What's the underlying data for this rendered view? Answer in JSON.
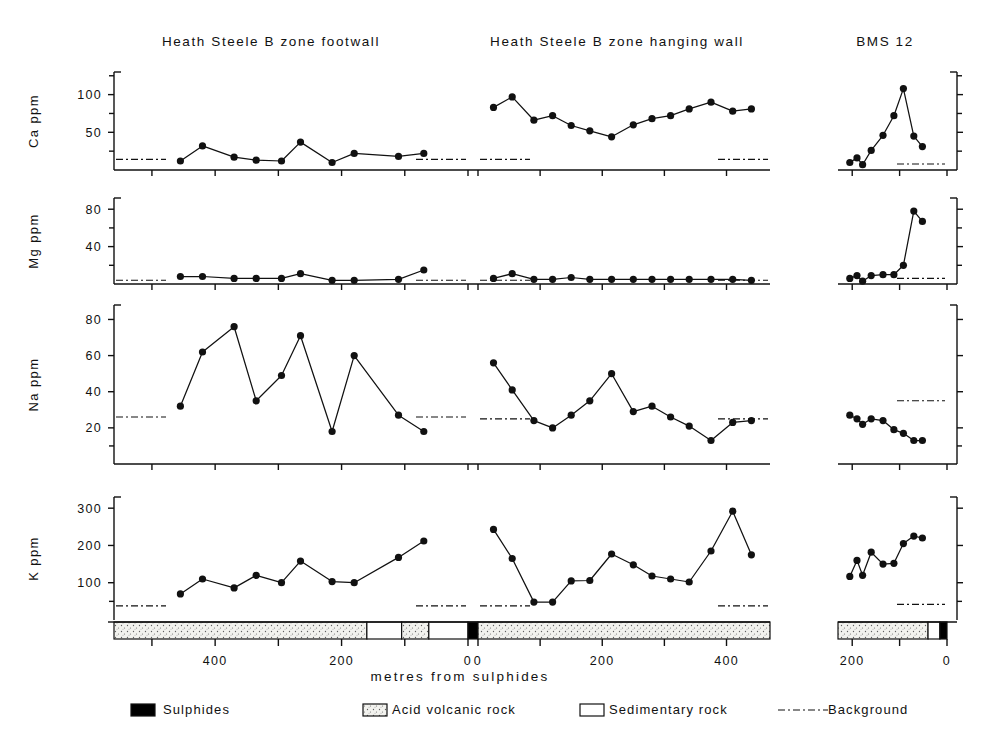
{
  "figure": {
    "xlabel": "metres from sulphides",
    "panel_titles": [
      "Heath Steele B zone footwall",
      "Heath Steele B zone hanging wall",
      "BMS 12"
    ],
    "row_labels": [
      "Ca ppm",
      "Mg ppm",
      "Na ppm",
      "K ppm"
    ]
  },
  "legend": {
    "items": [
      {
        "key": "sulphides",
        "label": "Sulphides",
        "swatch": "black-box",
        "color": "#000000"
      },
      {
        "key": "acid-volcanic",
        "label": "Acid volcanic rock",
        "swatch": "stippled-box",
        "color": "#e8e8e4"
      },
      {
        "key": "sedimentary",
        "label": "Sedimentary rock",
        "swatch": "white-box",
        "color": "#ffffff"
      },
      {
        "key": "background",
        "label": "Background",
        "swatch": "dash-dot-line",
        "color": "#111111"
      }
    ]
  },
  "axes": {
    "x_footwall": {
      "ticks": [
        500,
        400,
        300,
        200,
        100,
        0
      ],
      "labels": [
        "",
        "400",
        "",
        "200",
        "",
        "0"
      ],
      "range": [
        560,
        0
      ],
      "direction": "right-to-left"
    },
    "x_hangingwall": {
      "ticks": [
        0,
        100,
        200,
        300,
        400,
        500
      ],
      "labels": [
        "0",
        "",
        "200",
        "",
        "400",
        ""
      ],
      "range": [
        0,
        470
      ],
      "direction": "left-to-right"
    },
    "x_bms12": {
      "ticks": [
        200,
        100,
        0
      ],
      "labels": [
        "200",
        "",
        "0"
      ],
      "range": [
        230,
        0
      ],
      "direction": "right-to-left"
    },
    "y_ca": {
      "label": "Ca ppm",
      "ticks": [
        50,
        100
      ],
      "minor": [
        25,
        75,
        125
      ],
      "range": [
        0,
        130
      ]
    },
    "y_mg": {
      "label": "Mg ppm",
      "ticks": [
        40,
        80
      ],
      "minor": [
        20,
        60
      ],
      "range": [
        0,
        92
      ]
    },
    "y_na": {
      "label": "Na ppm",
      "ticks": [
        20,
        40,
        60,
        80
      ],
      "minor": [
        10
      ],
      "range": [
        0,
        88
      ]
    },
    "y_k": {
      "label": "K ppm",
      "ticks": [
        100,
        200,
        300
      ],
      "minor": [
        50
      ],
      "range": [
        0,
        330
      ]
    }
  },
  "chart_data": [
    {
      "type": "line",
      "title": "Ca ppm - Heath Steele B zone footwall",
      "panel": "footwall",
      "element": "Ca",
      "xlabel": "metres from sulphides",
      "ylabel": "Ca ppm",
      "xlim": [
        560,
        0
      ],
      "ylim": [
        0,
        130
      ],
      "grid": false,
      "background_level": 14,
      "x": [
        455,
        420,
        370,
        335,
        295,
        265,
        215,
        180,
        110,
        70
      ],
      "values": [
        12,
        32,
        17,
        13,
        12,
        37,
        10,
        22,
        18,
        22
      ]
    },
    {
      "type": "line",
      "title": "Ca ppm - Heath Steele B zone hanging wall",
      "panel": "hangingwall",
      "element": "Ca",
      "xlabel": "metres from sulphides",
      "ylabel": "Ca ppm",
      "xlim": [
        0,
        470
      ],
      "ylim": [
        0,
        130
      ],
      "grid": false,
      "background_level": 14,
      "x": [
        25,
        55,
        90,
        120,
        150,
        180,
        215,
        250,
        280,
        310,
        340,
        375,
        410,
        440
      ],
      "values": [
        83,
        97,
        66,
        72,
        59,
        52,
        44,
        60,
        68,
        72,
        81,
        90,
        78,
        81
      ]
    },
    {
      "type": "line",
      "title": "Ca ppm - BMS 12",
      "panel": "bms12",
      "element": "Ca",
      "xlabel": "metres from sulphides",
      "ylabel": "Ca ppm",
      "xlim": [
        230,
        0
      ],
      "ylim": [
        0,
        130
      ],
      "grid": false,
      "background_level": 8,
      "x": [
        205,
        190,
        178,
        160,
        135,
        112,
        92,
        70,
        52
      ],
      "values": [
        10,
        16,
        7,
        26,
        46,
        72,
        108,
        45,
        31
      ]
    },
    {
      "type": "line",
      "title": "Mg ppm - Heath Steele B zone footwall",
      "panel": "footwall",
      "element": "Mg",
      "xlabel": "metres from sulphides",
      "ylabel": "Mg ppm",
      "xlim": [
        560,
        0
      ],
      "ylim": [
        0,
        92
      ],
      "grid": false,
      "background_level": 4,
      "x": [
        455,
        420,
        370,
        335,
        295,
        265,
        215,
        180,
        110,
        70
      ],
      "values": [
        8,
        8,
        6,
        6,
        6,
        11,
        4,
        4,
        5,
        15
      ]
    },
    {
      "type": "line",
      "title": "Mg ppm - Heath Steele B zone hanging wall",
      "panel": "hangingwall",
      "element": "Mg",
      "xlabel": "metres from sulphides",
      "ylabel": "Mg ppm",
      "xlim": [
        0,
        470
      ],
      "ylim": [
        0,
        92
      ],
      "grid": false,
      "background_level": 4,
      "x": [
        25,
        55,
        90,
        120,
        150,
        180,
        215,
        250,
        280,
        310,
        340,
        375,
        410,
        440
      ],
      "values": [
        6,
        11,
        5,
        5,
        7,
        5,
        5,
        5,
        5,
        5,
        5,
        5,
        5,
        4
      ]
    },
    {
      "type": "line",
      "title": "Mg ppm - BMS 12",
      "panel": "bms12",
      "element": "Mg",
      "xlabel": "metres from sulphides",
      "ylabel": "Mg ppm",
      "xlim": [
        230,
        0
      ],
      "ylim": [
        0,
        92
      ],
      "grid": false,
      "background_level": 6,
      "x": [
        205,
        190,
        178,
        160,
        135,
        112,
        92,
        70,
        52
      ],
      "values": [
        6,
        9,
        3,
        9,
        10,
        10,
        20,
        78,
        67
      ]
    },
    {
      "type": "line",
      "title": "Na ppm - Heath Steele B zone footwall",
      "panel": "footwall",
      "element": "Na",
      "xlabel": "metres from sulphides",
      "ylabel": "Na ppm",
      "xlim": [
        560,
        0
      ],
      "ylim": [
        0,
        88
      ],
      "grid": false,
      "background_level": 26,
      "x": [
        455,
        420,
        370,
        335,
        295,
        265,
        215,
        180,
        110,
        70
      ],
      "values": [
        32,
        62,
        76,
        35,
        49,
        71,
        18,
        60,
        27,
        18
      ]
    },
    {
      "type": "line",
      "title": "Na ppm - Heath Steele B zone hanging wall",
      "panel": "hangingwall",
      "element": "Na",
      "xlabel": "metres from sulphides",
      "ylabel": "Na ppm",
      "xlim": [
        0,
        470
      ],
      "ylim": [
        0,
        88
      ],
      "grid": false,
      "background_level": 25,
      "x": [
        25,
        55,
        90,
        120,
        150,
        180,
        215,
        250,
        280,
        310,
        340,
        375,
        410,
        440
      ],
      "values": [
        56,
        41,
        24,
        20,
        27,
        35,
        50,
        29,
        32,
        26,
        21,
        13,
        23,
        24
      ]
    },
    {
      "type": "line",
      "title": "Na ppm - BMS 12",
      "panel": "bms12",
      "element": "Na",
      "xlabel": "metres from sulphides",
      "ylabel": "Na ppm",
      "xlim": [
        230,
        0
      ],
      "ylim": [
        0,
        88
      ],
      "grid": false,
      "background_level": 35,
      "x": [
        205,
        190,
        178,
        160,
        135,
        112,
        92,
        70,
        52
      ],
      "values": [
        27,
        25,
        22,
        25,
        24,
        19,
        17,
        13,
        13
      ]
    },
    {
      "type": "line",
      "title": "K ppm - Heath Steele B zone footwall",
      "panel": "footwall",
      "element": "K",
      "xlabel": "metres from sulphides",
      "ylabel": "K ppm",
      "xlim": [
        560,
        0
      ],
      "ylim": [
        0,
        330
      ],
      "grid": false,
      "background_level": 38,
      "x": [
        455,
        420,
        370,
        335,
        295,
        265,
        215,
        180,
        110,
        70
      ],
      "values": [
        70,
        110,
        86,
        120,
        100,
        158,
        103,
        100,
        168,
        212
      ]
    },
    {
      "type": "line",
      "title": "K ppm - Heath Steele B zone hanging wall",
      "panel": "hangingwall",
      "element": "K",
      "xlabel": "metres from sulphides",
      "ylabel": "K ppm",
      "xlim": [
        0,
        470
      ],
      "ylim": [
        0,
        330
      ],
      "grid": false,
      "background_level": 38,
      "x": [
        25,
        55,
        90,
        120,
        150,
        180,
        215,
        250,
        280,
        310,
        340,
        375,
        410,
        440
      ],
      "values": [
        243,
        165,
        48,
        48,
        105,
        106,
        177,
        148,
        118,
        110,
        102,
        185,
        292,
        175
      ]
    },
    {
      "type": "line",
      "title": "K ppm - BMS 12",
      "panel": "bms12",
      "element": "K",
      "xlabel": "metres from sulphides",
      "ylabel": "K ppm",
      "xlim": [
        230,
        0
      ],
      "ylim": [
        0,
        330
      ],
      "grid": false,
      "background_level": 42,
      "x": [
        205,
        190,
        178,
        160,
        135,
        112,
        92,
        70,
        52
      ],
      "values": [
        117,
        160,
        120,
        182,
        150,
        152,
        205,
        225,
        220
      ]
    }
  ],
  "geology_strip": {
    "footwall_hanging": [
      {
        "type": "acid-volcanic",
        "x0": 560,
        "x1": 160
      },
      {
        "type": "sedimentary",
        "x0": 160,
        "x1": 105
      },
      {
        "type": "acid-volcanic",
        "x0": 105,
        "x1": 60
      },
      {
        "type": "sedimentary",
        "x0": 60,
        "x1": 0
      }
    ],
    "sulphide_band": {
      "type": "sulphides"
    },
    "hanging_segments": [
      {
        "type": "acid-volcanic",
        "x0": 0,
        "x1": 470
      }
    ],
    "bms12": [
      {
        "type": "acid-volcanic",
        "x0": 230,
        "x1": 40
      },
      {
        "type": "sedimentary",
        "x0": 40,
        "x1": 15
      },
      {
        "type": "sulphides",
        "x0": 15,
        "x1": 0
      }
    ]
  }
}
